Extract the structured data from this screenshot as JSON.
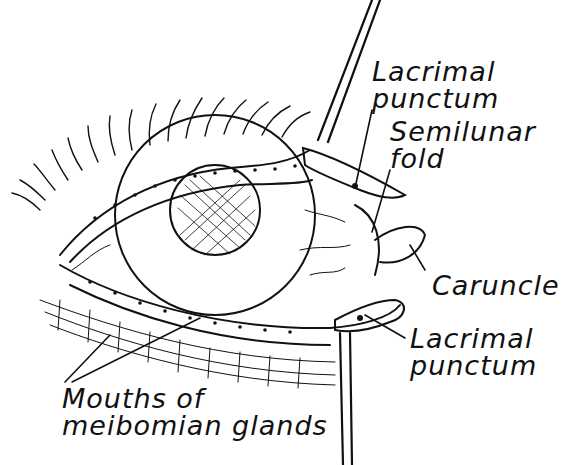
{
  "diagram": {
    "colors": {
      "ink": "#111111",
      "background": "#ffffff"
    },
    "labels": [
      {
        "id": "lacrimal-punctum-upper",
        "lines": [
          "Lacrimal",
          "punctum"
        ]
      },
      {
        "id": "semilunar-fold",
        "lines": [
          "Semilunar",
          "fold"
        ]
      },
      {
        "id": "caruncle",
        "lines": [
          "Caruncle"
        ]
      },
      {
        "id": "lacrimal-punctum-lower",
        "lines": [
          "Lacrimal",
          "punctum"
        ]
      },
      {
        "id": "mouths-of-meibomian-glands",
        "lines": [
          "Mouths of",
          "meibomian glands"
        ]
      }
    ]
  }
}
